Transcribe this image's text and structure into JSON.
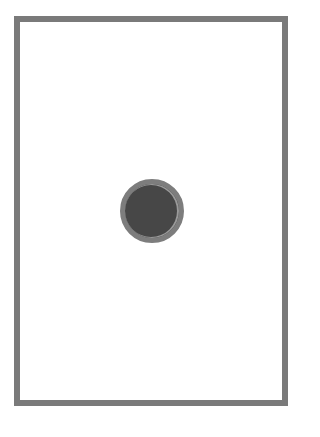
{
  "frame": {
    "border_color": "#7a7a7a",
    "background_color": "#ffffff"
  },
  "dot": {
    "icon": "circle-dot-icon",
    "fill_color": "#474747",
    "ring_color": "#7d7d7d"
  }
}
